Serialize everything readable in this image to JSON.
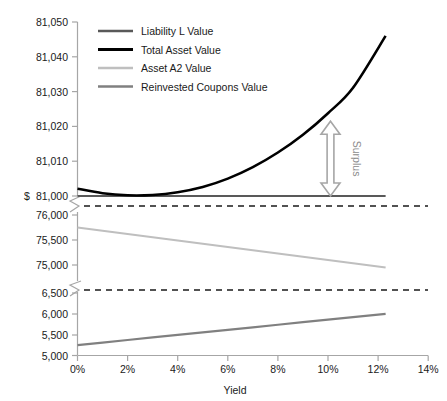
{
  "chart_data": {
    "type": "line",
    "title": "",
    "xlabel": "Yield",
    "ylabel": "$",
    "grid": false,
    "legend_position": "top-left-inside",
    "broken_axis": true,
    "x": [
      0,
      1,
      2,
      3,
      4,
      5,
      6,
      7,
      8,
      9,
      10,
      11,
      12.3
    ],
    "xtick_labels": [
      "0%",
      "2%",
      "4%",
      "6%",
      "8%",
      "10%",
      "12%",
      "14%"
    ],
    "xtick_values": [
      0,
      2,
      4,
      6,
      8,
      10,
      12,
      14
    ],
    "xlim": [
      0,
      14
    ],
    "y_panels": [
      {
        "name": "top-panel",
        "ylim": [
          81000,
          81050
        ],
        "ytick_labels": [
          "81,000",
          "81,010",
          "81,020",
          "81,030",
          "81,040",
          "81,050"
        ],
        "ytick_values": [
          81000,
          81010,
          81020,
          81030,
          81040,
          81050
        ]
      },
      {
        "name": "middle-panel",
        "ylim": [
          74750,
          76200
        ],
        "ytick_labels": [
          "75,000",
          "75,500",
          "76,000"
        ],
        "ytick_values": [
          75000,
          75500,
          76000
        ]
      },
      {
        "name": "bottom-panel",
        "ylim": [
          5000,
          6600
        ],
        "ytick_labels": [
          "5,000",
          "5,500",
          "6,000",
          "6,500"
        ],
        "ytick_values": [
          5000,
          5500,
          6000,
          6500
        ]
      }
    ],
    "series": [
      {
        "name": "Liability L Value",
        "color": "#595959",
        "width": 2.2,
        "panel": "top-panel",
        "values": [
          81000,
          81000,
          81000,
          81000,
          81000,
          81000,
          81000,
          81000,
          81000,
          81000,
          81000,
          81000,
          81000
        ]
      },
      {
        "name": "Total Asset Value",
        "color": "#000000",
        "width": 2.6,
        "panel": "top-panel",
        "values": [
          81002.1,
          81000.8,
          81000.2,
          81000.3,
          81001.1,
          81002.6,
          81005.0,
          81008.3,
          81012.5,
          81017.6,
          81023.8,
          81031.1,
          81046.0
        ]
      },
      {
        "name": "Asset A2 Value",
        "color": "#bfbfbf",
        "width": 2.2,
        "panel": "middle-panel",
        "values": [
          75750,
          75685,
          75620,
          75555,
          75490,
          75425,
          75360,
          75295,
          75230,
          75165,
          75100,
          75035,
          74950
        ]
      },
      {
        "name": "Reinvested Coupons Value",
        "color": "#808080",
        "width": 2.2,
        "panel": "bottom-panel",
        "values": [
          5250,
          5311,
          5372,
          5433,
          5494,
          5555,
          5616,
          5677,
          5738,
          5799,
          5860,
          5921,
          6000
        ]
      }
    ],
    "annotations": [
      {
        "name": "surplus-arrow",
        "label": "Surplus",
        "color": "#a6a6a6",
        "x_percent": 10.1,
        "from_value": 81021.5,
        "to_value": 81000
      }
    ]
  },
  "legend": {
    "items": [
      {
        "label": "Liability L Value",
        "color": "#595959",
        "thickness": 2.2
      },
      {
        "label": "Total Asset Value",
        "color": "#000000",
        "thickness": 3.0
      },
      {
        "label": "Asset A2 Value",
        "color": "#bfbfbf",
        "thickness": 2.2
      },
      {
        "label": "Reinvested Coupons Value",
        "color": "#808080",
        "thickness": 2.2
      }
    ]
  },
  "axes": {
    "y_axis_symbol": "$",
    "x_axis_title": "Yield",
    "y_ticks_top": [
      "81,050",
      "81,040",
      "81,030",
      "81,020",
      "81,010",
      "81,000"
    ],
    "y_ticks_middle": [
      "76,000",
      "75,500",
      "75,000"
    ],
    "y_ticks_bottom": [
      "6,500",
      "6,000",
      "5,500",
      "5,000"
    ],
    "x_ticks": [
      "0%",
      "2%",
      "4%",
      "6%",
      "8%",
      "10%",
      "12%",
      "14%"
    ]
  },
  "colors": {
    "axis": "#a6a6a6",
    "text": "#1a1a1a",
    "liability": "#595959",
    "total_asset": "#000000",
    "asset_a2": "#bfbfbf",
    "reinvested": "#808080",
    "annotation": "#a6a6a6",
    "background": "#ffffff"
  }
}
